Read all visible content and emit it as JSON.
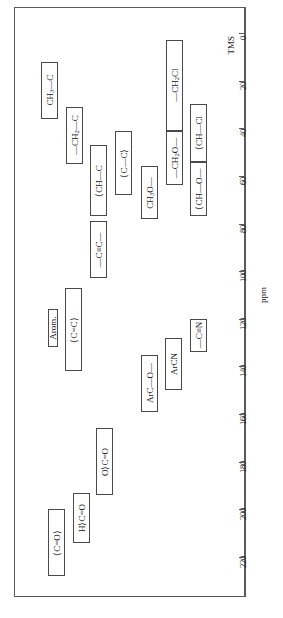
{
  "chart_data": {
    "type": "bar",
    "orientation": "vertical-ranges",
    "title": "",
    "xlabel": "",
    "ylabel": "ppm",
    "axis_unit": "ppm",
    "reference_label": "TMS",
    "reference_value": 0,
    "ylim": [
      0,
      220
    ],
    "tick_interval": 20,
    "tick_labels": [
      "0",
      "20",
      "40",
      "60",
      "80",
      "100",
      "120",
      "140",
      "160",
      "180",
      "200",
      "220"
    ],
    "tick_values": [
      0,
      20,
      40,
      60,
      80,
      100,
      120,
      140,
      160,
      180,
      200,
      220
    ],
    "grid": false,
    "legend": "none",
    "ranges": [
      {
        "label": "CH₃—C",
        "html": "CH<sub>3</sub>—C",
        "from": 12,
        "to": 36,
        "col": 0
      },
      {
        "label": "—CH₂—C",
        "html": "—CH<sub>2</sub>—C",
        "from": 31,
        "to": 55,
        "col": 1
      },
      {
        "label": ">CH—C",
        "html": "⟨CH—C",
        "from": 47,
        "to": 77,
        "col": 2
      },
      {
        "label": ">C—C<",
        "html": "⟨C—C⟩",
        "from": 41,
        "to": 68,
        "col": 3
      },
      {
        "label": "CH₃O—",
        "html": "CH<sub>3</sub>O—",
        "from": 56,
        "to": 78,
        "col": 4
      },
      {
        "label": "—CH₂Cl",
        "html": "—CH<sub>2</sub>Cl",
        "from": 3,
        "to": 41,
        "col": 5
      },
      {
        "label": "—CH₂O—",
        "html": "—CH<sub>2</sub>O—",
        "from": 41,
        "to": 64,
        "col": 5
      },
      {
        "label": ">CH—Cl",
        "html": "⟨CH—Cl",
        "from": 30,
        "to": 54,
        "col": 6
      },
      {
        "label": ">CH—O—",
        "html": "⟨CH—O—",
        "from": 54,
        "to": 77,
        "col": 6
      },
      {
        "label": "—C≡C—",
        "html": "—C≡C—",
        "from": 79,
        "to": 103,
        "col": 2
      },
      {
        "label": "Arom.",
        "html": "Arom.",
        "from": 116,
        "to": 132,
        "col": 0
      },
      {
        "label": ">C=C<",
        "html": "⟨C=C⟩",
        "from": 107,
        "to": 142,
        "col": 1
      },
      {
        "label": "ArC—O—",
        "html": "ArC—O—",
        "from": 135,
        "to": 159,
        "col": 4
      },
      {
        "label": "ArCN",
        "html": "ArCN",
        "from": 128,
        "to": 150,
        "col": 5
      },
      {
        "label": "—C≡N",
        "html": "—C≡N",
        "from": 120,
        "to": 134,
        "col": 6
      },
      {
        "label": "O>C=O",
        "html": "O⟩C=O",
        "from": 166,
        "to": 194,
        "col": 3
      },
      {
        "label": "H>C=O",
        "html": "H⟩C=O",
        "from": 193,
        "to": 214,
        "col": 2
      },
      {
        "label": ">C=O",
        "html": "⟨C=O⟩",
        "from": 200,
        "to": 228,
        "col": 1
      }
    ]
  },
  "chart": {
    "axis_title": "ppm",
    "reference": "TMS"
  }
}
